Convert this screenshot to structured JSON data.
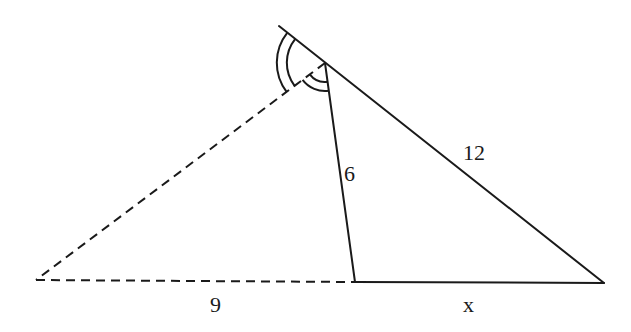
{
  "diagram": {
    "colors": {
      "stroke": "#1a1a1a",
      "background": "#ffffff"
    },
    "points": {
      "top_ext": [
        279,
        26
      ],
      "apex": [
        325,
        63
      ],
      "left": [
        36,
        280
      ],
      "foot": [
        355,
        282
      ],
      "right": [
        604,
        283
      ]
    },
    "segments": [
      {
        "name": "side-12",
        "from": "top_ext",
        "to": "right",
        "style": "solid",
        "label": "12"
      },
      {
        "name": "cevian-6",
        "from": "apex",
        "to": "foot",
        "style": "solid",
        "label": "6"
      },
      {
        "name": "dashed-side",
        "from": "apex",
        "to": "left",
        "style": "dashed",
        "label": ""
      },
      {
        "name": "base-9",
        "from": "left",
        "to": "foot",
        "style": "dashed",
        "label": "9"
      },
      {
        "name": "base-x",
        "from": "foot",
        "to": "right",
        "style": "solid",
        "label": "x"
      }
    ],
    "labels": {
      "side_12": "12",
      "cevian_6": "6",
      "base_9": "9",
      "base_x": "x"
    },
    "angle_marks": [
      {
        "name": "outer-angle-mark",
        "center": "apex",
        "arcs": 2,
        "between": [
          "top_ext",
          "left"
        ]
      },
      {
        "name": "inner-angle-mark",
        "center": "apex",
        "arcs": 2,
        "between": [
          "left",
          "foot"
        ]
      }
    ]
  }
}
